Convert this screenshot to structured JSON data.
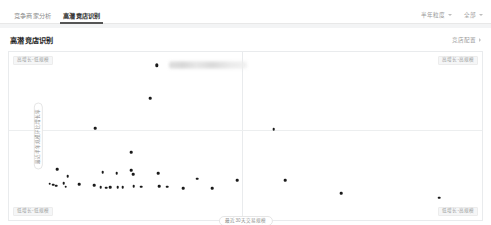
{
  "tabs": [
    {
      "label": "竞争商家分析",
      "active": false
    },
    {
      "label": "高潜竞店识别",
      "active": true
    }
  ],
  "header_filters": [
    {
      "label": "半年粒度",
      "icon": "chevron-down-icon"
    },
    {
      "label": "全部",
      "icon": "chevron-down-icon"
    }
  ],
  "section": {
    "title": "高潜竞店识别",
    "config_link": "竞店配置",
    "config_icon": "chevron-right-icon"
  },
  "chart_data": {
    "type": "scatter",
    "title": "高潜竞店识别",
    "xlabel": "最近30天交易规模",
    "ylabel": "最近半年规模环比增长率",
    "xlim": [
      0,
      100
    ],
    "ylim": [
      0,
      100
    ],
    "grid": false,
    "legend": "none",
    "quadrant_labels": {
      "top_left": "高增长-低规模",
      "top_right": "高增长-高规模",
      "bottom_left": "低增长-低规模",
      "bottom_right": "低增长-高规模"
    },
    "quadrant_split": {
      "x": 49.2,
      "y": 53.5
    },
    "annotation": {
      "text": "",
      "redacted": true,
      "x": 32.5,
      "y": 92.0
    },
    "points": [
      {
        "x": 31.2,
        "y": 92.0,
        "highlight": true
      },
      {
        "x": 29.8,
        "y": 72.5,
        "highlight": false
      },
      {
        "x": 18.2,
        "y": 54.8,
        "highlight": false
      },
      {
        "x": 56.0,
        "y": 54.0,
        "highlight": false
      },
      {
        "x": 25.8,
        "y": 40.5,
        "highlight": false
      },
      {
        "x": 10.2,
        "y": 30.2,
        "highlight": false
      },
      {
        "x": 12.4,
        "y": 26.0,
        "highlight": false
      },
      {
        "x": 19.8,
        "y": 28.4,
        "highlight": false
      },
      {
        "x": 22.8,
        "y": 28.0,
        "highlight": false
      },
      {
        "x": 25.8,
        "y": 29.6,
        "highlight": false
      },
      {
        "x": 26.2,
        "y": 27.4,
        "highlight": false
      },
      {
        "x": 31.6,
        "y": 27.8,
        "highlight": false
      },
      {
        "x": 39.8,
        "y": 24.6,
        "highlight": false
      },
      {
        "x": 8.6,
        "y": 21.6,
        "highlight": false
      },
      {
        "x": 9.4,
        "y": 21.0,
        "highlight": false
      },
      {
        "x": 10.0,
        "y": 20.4,
        "highlight": false
      },
      {
        "x": 11.6,
        "y": 21.8,
        "highlight": false
      },
      {
        "x": 12.0,
        "y": 19.8,
        "highlight": false
      },
      {
        "x": 14.8,
        "y": 21.2,
        "highlight": false
      },
      {
        "x": 18.0,
        "y": 20.6,
        "highlight": false
      },
      {
        "x": 19.4,
        "y": 19.4,
        "highlight": false
      },
      {
        "x": 20.6,
        "y": 19.2,
        "highlight": false
      },
      {
        "x": 21.4,
        "y": 19.4,
        "highlight": false
      },
      {
        "x": 23.0,
        "y": 19.6,
        "highlight": false
      },
      {
        "x": 24.0,
        "y": 19.6,
        "highlight": false
      },
      {
        "x": 26.4,
        "y": 20.0,
        "highlight": false
      },
      {
        "x": 28.0,
        "y": 19.8,
        "highlight": false
      },
      {
        "x": 31.8,
        "y": 20.2,
        "highlight": false
      },
      {
        "x": 33.4,
        "y": 19.8,
        "highlight": false
      },
      {
        "x": 36.8,
        "y": 18.8,
        "highlight": false
      },
      {
        "x": 43.0,
        "y": 19.0,
        "highlight": false
      },
      {
        "x": 48.2,
        "y": 23.8,
        "highlight": false
      },
      {
        "x": 58.4,
        "y": 23.6,
        "highlight": false
      },
      {
        "x": 70.2,
        "y": 15.8,
        "highlight": false
      },
      {
        "x": 91.0,
        "y": 13.2,
        "highlight": false
      }
    ]
  }
}
